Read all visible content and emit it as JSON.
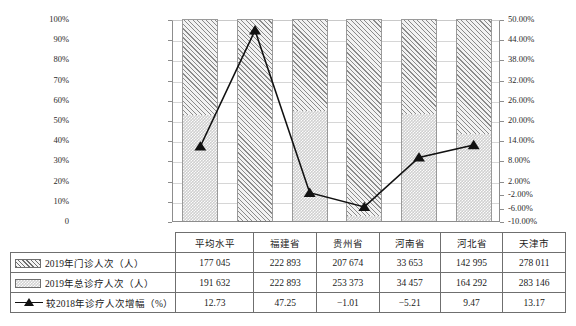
{
  "chart_data": {
    "type": "bar",
    "title": "",
    "subtitle": "",
    "xlabel": "",
    "ylabel": "",
    "categories": [
      "平均水平",
      "福建省",
      "贵州省",
      "河南省",
      "河北省",
      "天津市"
    ],
    "grid": true,
    "legend_position": "table-row-labels",
    "left_axis": {
      "label": "",
      "ylim": [
        0,
        100
      ],
      "unit": "%",
      "ticks": [
        "0",
        "10%",
        "20%",
        "30%",
        "40%",
        "50%",
        "60%",
        "70%",
        "80%",
        "90%",
        "100%"
      ],
      "tick_values": [
        0,
        10,
        20,
        30,
        40,
        50,
        60,
        70,
        80,
        90,
        100
      ]
    },
    "right_axis": {
      "label": "",
      "ylim": [
        -10,
        50
      ],
      "unit": "%",
      "ticks": [
        "-10.00%",
        "-6.00%",
        "-2.00%",
        "2.00%",
        "8.00%",
        "14.00%",
        "20.00%",
        "26.00%",
        "32.00%",
        "38.00%",
        "44.00%",
        "50.00%"
      ],
      "tick_values": [
        -10,
        -6,
        -2,
        2,
        8,
        14,
        20,
        26,
        32,
        38,
        44,
        50
      ]
    },
    "series": [
      {
        "name": "2019年门诊人次（人）",
        "type": "bar-stacked-top",
        "axis": "left",
        "pattern": "diagonal-hatch",
        "values": [
          177045,
          222893,
          207674,
          33653,
          142995,
          278011
        ],
        "display": [
          "177 045",
          "222 893",
          "207 674",
          "33 653",
          "142 995",
          "278 011"
        ],
        "share_percent": [
          47.7,
          100.0,
          45.5,
          97.7,
          47.0,
          56.9
        ]
      },
      {
        "name": "2019年总诊疗人次（人）",
        "type": "bar-stacked-bottom",
        "axis": "left",
        "pattern": "checker-dots",
        "values": [
          191632,
          222893,
          253373,
          34457,
          164292,
          283146
        ],
        "display": [
          "191 632",
          "222 893",
          "253 373",
          "34 457",
          "164 292",
          "283 146"
        ],
        "share_percent": [
          52.3,
          0.0,
          54.5,
          2.3,
          53.0,
          43.1
        ]
      },
      {
        "name": "较2018年诊疗人次增幅（%）",
        "type": "line-marker",
        "axis": "right",
        "marker": "triangle",
        "values": [
          12.73,
          47.25,
          -1.01,
          -5.21,
          9.47,
          13.17
        ],
        "display": [
          "12.73",
          "47.25",
          "−1.01",
          "−5.21",
          "9.47",
          "13.17"
        ]
      }
    ]
  },
  "table": {
    "corner": "",
    "header_row": [
      "平均水平",
      "福建省",
      "贵州省",
      "河南省",
      "河北省",
      "天津市"
    ],
    "rows": [
      {
        "icon": "hatch-swatch-icon",
        "label": "2019年门诊人次（人）",
        "cells": [
          "177 045",
          "222 893",
          "207 674",
          "33 653",
          "142 995",
          "278 011"
        ]
      },
      {
        "icon": "dots-swatch-icon",
        "label": "2019年总诊疗人次（人）",
        "cells": [
          "191 632",
          "222 893",
          "253 373",
          "34 457",
          "164 292",
          "283 146"
        ]
      },
      {
        "icon": "line-triangle-marker-icon",
        "label": "较2018年诊疗人次增幅（%）",
        "cells": [
          "12.73",
          "47.25",
          "−1.01",
          "−5.21",
          "9.47",
          "13.17"
        ]
      }
    ]
  },
  "colors": {
    "line": "#111111",
    "grid": "#d6d6d6",
    "axis": "#8d8d8d",
    "bar_hatch": "#8a8a8a",
    "bar_fill": "#cfcfcf",
    "table_border": "#6f6f6f"
  }
}
